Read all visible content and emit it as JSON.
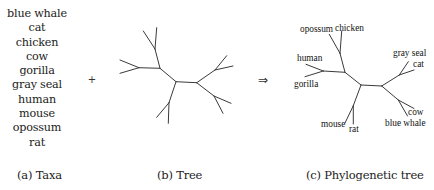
{
  "taxa": {
    "items": [
      "blue whale",
      "cat",
      "chicken",
      "cow",
      "gorilla",
      "gray seal",
      "human",
      "mouse",
      "opossum",
      "rat"
    ],
    "caption": "(a) Taxa"
  },
  "operators": {
    "plus": "+",
    "implies": "⇒"
  },
  "tree": {
    "caption": "(b) Tree"
  },
  "phylogenetic_tree": {
    "caption": "(c) Phylogenetic tree",
    "leaf_labels": {
      "opossum": "opossum",
      "chicken": "chicken",
      "human": "human",
      "gorilla": "gorilla",
      "gray_seal": "gray seal",
      "cat": "cat",
      "cow": "cow",
      "blue_whale": "blue whale",
      "mouse": "mouse",
      "rat": "rat"
    },
    "clades": [
      [
        "opossum",
        "chicken"
      ],
      [
        "human",
        "gorilla"
      ],
      [
        "mouse",
        "rat"
      ],
      [
        "gray seal",
        "cat"
      ],
      [
        "cow",
        "blue whale"
      ]
    ]
  },
  "colors": {
    "line": "#3a3a3a",
    "text": "#222222",
    "background": "#ffffff"
  }
}
